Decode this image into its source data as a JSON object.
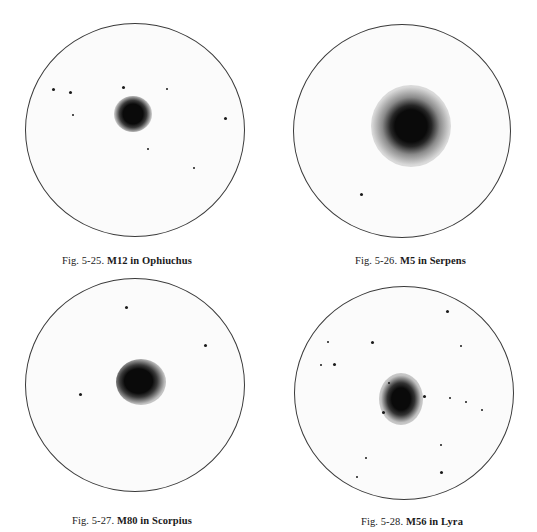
{
  "figures": [
    {
      "id": "5-25",
      "caption_prefix": "Fig. 5-25.",
      "caption_title": "M12 in Ophiuchus",
      "object": "M12",
      "constellation": "Ophiuchus"
    },
    {
      "id": "5-26",
      "caption_prefix": "Fig. 5-26.",
      "caption_title": "M5 in Serpens",
      "object": "M5",
      "constellation": "Serpens"
    },
    {
      "id": "5-27",
      "caption_prefix": "Fig. 5-27.",
      "caption_title": "M80 in Scorpius",
      "object": "M80",
      "constellation": "Scorpius"
    },
    {
      "id": "5-28",
      "caption_prefix": "Fig. 5-28.",
      "caption_title": "M56 in Lyra",
      "object": "M56",
      "constellation": "Lyra"
    }
  ]
}
